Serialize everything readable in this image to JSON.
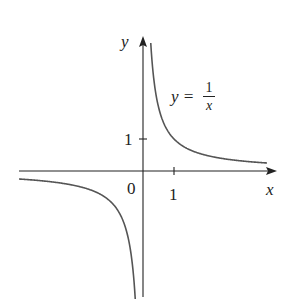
{
  "chart_data": {
    "type": "line",
    "title": "",
    "function": "y = 1/x",
    "annotation": {
      "lhs": "y =",
      "numerator": "1",
      "denominator": "x"
    },
    "xlabel": "x",
    "ylabel": "y",
    "origin_label": "0",
    "x_ticks": [
      {
        "value": 1,
        "label": "1"
      }
    ],
    "y_ticks": [
      {
        "value": 1,
        "label": "1"
      }
    ],
    "xlim": [
      -4,
      4.3
    ],
    "ylim": [
      -4,
      4.2
    ],
    "grid": false,
    "legend": "none",
    "series": [
      {
        "name": "y=1/x (x<0)",
        "x": [
          -4,
          -3,
          -2,
          -1,
          -0.5,
          -0.3,
          -0.25
        ],
        "y": [
          -0.25,
          -0.33,
          -0.5,
          -1,
          -2,
          -3.33,
          -4
        ]
      },
      {
        "name": "y=1/x (x>0)",
        "x": [
          0.25,
          0.3,
          0.5,
          1,
          2,
          3,
          4
        ],
        "y": [
          4,
          3.33,
          2,
          1,
          0.5,
          0.33,
          0.25
        ]
      }
    ]
  },
  "colors": {
    "axis": "#222222",
    "curve": "#555555"
  }
}
